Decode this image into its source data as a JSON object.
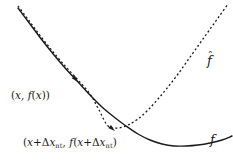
{
  "figure": {
    "background_color": "#ffffff",
    "stroke_color": "#1a1a1a",
    "width": 233,
    "height": 162
  },
  "labels": {
    "point_x": {
      "open_paren": "(",
      "var": "x",
      "comma": ", ",
      "func": "f",
      "func_open": "(",
      "func_var": "x",
      "func_close": ")",
      "close_paren": ")",
      "plain_text": "(x, f(x))"
    },
    "point_step": {
      "open_paren": "(",
      "var": "x",
      "plus": "+",
      "delta": "Δ",
      "delta_var": "x",
      "subscript": "nt",
      "comma": ", ",
      "func": "f",
      "func_open": "(",
      "close_paren": ")",
      "plain_text": "(x+Δx_nt, f(x+Δx_nt))"
    },
    "curve_fhat": {
      "symbol": "f",
      "accent": "ˆ",
      "plain_text": "f̂"
    },
    "curve_f": {
      "symbol": "f",
      "plain_text": "f"
    }
  },
  "chart_data": {
    "type": "line",
    "title": "",
    "xlabel": "",
    "ylabel": "",
    "grid": false,
    "legend_position": "inline-right",
    "axes_visible": false,
    "xlim": [
      0,
      233
    ],
    "ylim": [
      162,
      0
    ],
    "series": [
      {
        "name": "f",
        "label": "f",
        "style": "solid",
        "stroke": "#1a1a1a",
        "stroke_width": 1.4,
        "description": "Solid curve: true function, convex, minimum near x=165, flattens to the right",
        "points": [
          [
            18,
            8
          ],
          [
            30,
            24
          ],
          [
            42,
            40
          ],
          [
            54,
            55
          ],
          [
            66,
            69
          ],
          [
            78,
            82
          ],
          [
            90,
            95
          ],
          [
            102,
            107
          ],
          [
            114,
            117
          ],
          [
            126,
            126
          ],
          [
            138,
            134
          ],
          [
            150,
            140
          ],
          [
            162,
            144
          ],
          [
            174,
            146
          ],
          [
            186,
            146
          ],
          [
            198,
            145
          ],
          [
            210,
            143
          ],
          [
            222,
            140
          ],
          [
            232,
            136
          ]
        ]
      },
      {
        "name": "f-hat",
        "label": "f̂",
        "style": "dashed",
        "stroke": "#1a1a1a",
        "stroke_width": 1.3,
        "dash_pattern": [
          2,
          2.4
        ],
        "description": "Dashed curve: quadratic approximation, tangent to f at upper left, minimum near x=108, rises steeply to the top right",
        "points": [
          [
            18,
            6
          ],
          [
            30,
            22
          ],
          [
            42,
            38
          ],
          [
            54,
            53
          ],
          [
            66,
            67
          ],
          [
            78,
            80
          ],
          [
            90,
            94
          ],
          [
            99,
            110
          ],
          [
            108,
            126
          ],
          [
            118,
            128
          ],
          [
            128,
            125
          ],
          [
            138,
            119
          ],
          [
            148,
            110
          ],
          [
            158,
            99
          ],
          [
            168,
            87
          ],
          [
            178,
            74
          ],
          [
            188,
            60
          ],
          [
            198,
            46
          ],
          [
            208,
            32
          ],
          [
            218,
            18
          ],
          [
            228,
            4
          ]
        ]
      }
    ],
    "annotations": [
      {
        "name": "point-x",
        "text": "(x, f(x))",
        "x": 11,
        "y": 90,
        "target": [
          76,
          80
        ]
      },
      {
        "name": "point-step",
        "text": "(x+Δx_nt, f(x+Δx_nt))",
        "x": 23,
        "y": 137,
        "target": [
          113,
          130
        ]
      },
      {
        "name": "curve-label-fhat",
        "text": "f̂",
        "x": 207,
        "y": 54
      },
      {
        "name": "curve-label-f",
        "text": "f",
        "x": 210,
        "y": 133
      }
    ],
    "arrow_markers": [
      {
        "name": "arrow-to-point-x",
        "tip": [
          78,
          82
        ],
        "angle_deg": 48
      },
      {
        "name": "arrow-to-point-step",
        "tip": [
          115,
          131
        ],
        "angle_deg": 40
      }
    ]
  }
}
